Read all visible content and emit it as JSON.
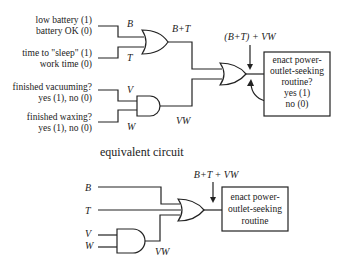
{
  "top_circuit": {
    "inputs": [
      {
        "line1": "low battery (1)",
        "line2": "battery OK (0)",
        "signal": "B"
      },
      {
        "line1": "time to \"sleep\" (1)",
        "line2": "work time (0)",
        "signal": "T"
      },
      {
        "line1": "finished vacuuming?",
        "line2": "yes (1), no (0)",
        "signal": "V"
      },
      {
        "line1": "finished waxing?",
        "line2": "yes (1), no (0)",
        "signal": "W"
      }
    ],
    "or_output_label": "B+T",
    "and_output_label": "VW",
    "final_label": "(B+T) + VW",
    "box": {
      "lines": [
        "enact power-",
        "outlet-seeking",
        "routine?",
        "yes (1)",
        "no (0)"
      ]
    }
  },
  "caption": "equivalent circuit",
  "bottom_circuit": {
    "inputs": [
      "B",
      "T",
      "V",
      "W"
    ],
    "and_output_label": "VW",
    "final_label": "B+T + VW",
    "box": {
      "lines": [
        "enact power-",
        "outlet-seeking",
        "routine"
      ]
    }
  }
}
